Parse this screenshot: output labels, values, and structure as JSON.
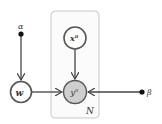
{
  "diagram": {
    "type": "graphical-model",
    "nodes": {
      "alpha": {
        "label": "α",
        "kind": "hyperparameter"
      },
      "beta": {
        "label": "β",
        "kind": "hyperparameter"
      },
      "w": {
        "label": "w",
        "kind": "latent"
      },
      "x": {
        "label": "x",
        "sup": "n",
        "kind": "latent"
      },
      "y": {
        "label": "y",
        "sup": "n",
        "kind": "observed"
      }
    },
    "plate": {
      "label": "N"
    },
    "edges": [
      {
        "from": "alpha",
        "to": "w"
      },
      {
        "from": "w",
        "to": "y"
      },
      {
        "from": "x",
        "to": "y"
      },
      {
        "from": "beta",
        "to": "y"
      }
    ],
    "colors": {
      "stroke": "#555555",
      "observed_fill": "#cfcfcf",
      "plate": "#c8c8c8"
    }
  }
}
